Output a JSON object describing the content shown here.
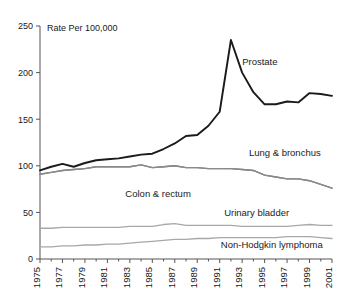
{
  "chart_data": {
    "type": "line",
    "title": "",
    "axis_note": "Rate Per 100,000",
    "xlabel": "",
    "ylabel": "",
    "xlim": [
      1975,
      2001
    ],
    "ylim": [
      0,
      250
    ],
    "yticks": [
      0,
      50,
      100,
      150,
      200,
      250
    ],
    "ytick_labels": [
      "0",
      "50",
      "100",
      "150",
      "200",
      "250"
    ],
    "x": [
      1975,
      1976,
      1977,
      1978,
      1979,
      1980,
      1981,
      1982,
      1983,
      1984,
      1985,
      1986,
      1987,
      1988,
      1989,
      1990,
      1991,
      1992,
      1993,
      1994,
      1995,
      1996,
      1997,
      1998,
      1999,
      2000,
      2001
    ],
    "xtick_labels": [
      "1975",
      "1977",
      "1979",
      "1981",
      "1983",
      "1985",
      "1987",
      "1989",
      "1991",
      "1993",
      "1995",
      "1997",
      "1999",
      "2001"
    ],
    "grid": false,
    "legend": "inline-annotations",
    "series": [
      {
        "name": "Prostate",
        "color": "#1a1a1a",
        "width": 1.9,
        "label_x": 1993.0,
        "label_y": 208,
        "values": [
          95,
          99,
          102,
          99,
          103,
          106,
          107,
          108,
          110,
          112,
          113,
          118,
          124,
          132,
          133,
          143,
          158,
          235,
          200,
          179,
          166,
          166,
          169,
          168,
          178,
          177,
          175
        ]
      },
      {
        "name": "Lung & bronchus",
        "color": "#7a7a7a",
        "width": 1.4,
        "label_x": 1993.6,
        "label_y": 111,
        "values": [
          91,
          93,
          95,
          96,
          97,
          99,
          99,
          99,
          99,
          101,
          98,
          99,
          100,
          98,
          98,
          97,
          97,
          97,
          96,
          95,
          90,
          88,
          86,
          86,
          84,
          80,
          76
        ]
      },
      {
        "name": "Colon & rectum",
        "color": "#8a8a8a",
        "width": 1.4,
        "label_x": 1982.6,
        "label_y": 66,
        "values": [
          91,
          93,
          95,
          96,
          97,
          99,
          99,
          99,
          99,
          101,
          98,
          99,
          100,
          98,
          98,
          97,
          97,
          97,
          96,
          95,
          90,
          88,
          86,
          86,
          84,
          80,
          76
        ]
      },
      {
        "name": "Urinary bladder",
        "color": "#a8a8a8",
        "width": 1.3,
        "label_x": 1991.4,
        "label_y": 46,
        "values": [
          33,
          33,
          34,
          34,
          34,
          34,
          34,
          34,
          35,
          35,
          35,
          37,
          38,
          36,
          36,
          36,
          36,
          36,
          35,
          35,
          35,
          35,
          35,
          36,
          37,
          36,
          36
        ]
      },
      {
        "name": "Non-Hodgkin lymphoma",
        "color": "#a8a8a8",
        "width": 1.3,
        "label_x": 1991.1,
        "label_y": 12,
        "values": [
          13,
          13,
          14,
          14,
          15,
          15,
          16,
          16,
          17,
          18,
          19,
          20,
          21,
          21,
          22,
          22,
          23,
          23,
          23,
          23,
          23,
          23,
          24,
          24,
          24,
          23,
          22
        ]
      }
    ]
  }
}
